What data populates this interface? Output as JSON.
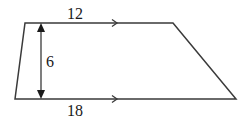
{
  "figure": {
    "type": "trapezoid",
    "stroke_color": "#3a3a3a",
    "vertices": {
      "top_left": [
        25,
        23
      ],
      "top_right": [
        173,
        23
      ],
      "bottom_right": [
        236,
        99
      ],
      "bottom_left": [
        15,
        99
      ]
    },
    "labels": {
      "top_base": "12",
      "bottom_base": "18",
      "height": "6"
    },
    "parallel_marks": {
      "top": "single-arrow",
      "bottom": "single-arrow"
    },
    "height_segment": {
      "x": 41,
      "y_top": 23,
      "y_bottom": 99,
      "arrowheads": "both-ends"
    }
  }
}
